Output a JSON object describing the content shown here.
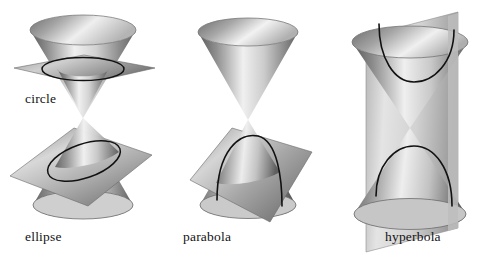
{
  "figure": {
    "background_color": "#ffffff",
    "ink_color": "#131313"
  },
  "captions": {
    "circle": "circle",
    "ellipse": "ellipse",
    "parabola": "parabola",
    "hyperbola": "hyperbola"
  },
  "diagram_data": {
    "type": "diagram",
    "subject": "conic sections formed by intersecting a plane with a double cone",
    "palette": {
      "cone_dark": "#4a4a4a",
      "cone_mid": "#9a9a9a",
      "cone_light": "#f2f2f2",
      "plane_dark": "#5d5d5d",
      "plane_mid": "#a8a8a8",
      "plane_light": "#ededed",
      "curve": "#111111",
      "background": "#ffffff"
    },
    "panels": [
      {
        "name": "circle-and-ellipse",
        "cones": "double cone (two nappes meeting at a single apex)",
        "sections": [
          {
            "curve": "circle",
            "plane_orientation": "horizontal, perpendicular to the cone axis",
            "nappe": "upper",
            "label": "circle"
          },
          {
            "curve": "ellipse",
            "plane_orientation": "tilted, oblique to the axis but cutting only one nappe",
            "nappe": "lower",
            "label": "ellipse"
          }
        ]
      },
      {
        "name": "parabola",
        "cones": "double cone (two nappes meeting at a single apex)",
        "sections": [
          {
            "curve": "parabola",
            "plane_orientation": "tilted parallel to a generating line of the cone",
            "nappe": "lower",
            "label": "parabola"
          }
        ]
      },
      {
        "name": "hyperbola",
        "cones": "double cone (two nappes meeting at a single apex)",
        "sections": [
          {
            "curve": "hyperbola",
            "plane_orientation": "vertical, parallel to the cone axis, cutting both nappes",
            "nappe": "both",
            "label": "hyperbola",
            "branches": 2
          }
        ]
      }
    ]
  }
}
